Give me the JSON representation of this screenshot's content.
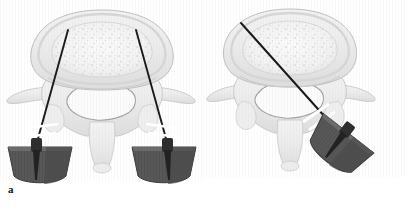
{
  "figure": {
    "caption_labels": {
      "panel_a": "a",
      "panel_b": "b"
    },
    "background_color": "#ffffff",
    "bone_fill_color": "#f0f0f0",
    "bone_outline_color": "#b8b8b8",
    "cancellous_speckle_color": "#cfcfcf",
    "needle_color": "#1a1a1a",
    "handle_color": "#5a5a5a",
    "handle_dark_color": "#3f3f3f",
    "break_mark_color": "#e8e8e8"
  },
  "panels": [
    {
      "id": "a",
      "label": "a",
      "title": "Bipedicular approach",
      "anatomy": "axial lumbar vertebra",
      "needle_count": 2,
      "instrument_count": 2,
      "parts": [
        "vertebral-body",
        "cancellous-bone",
        "spinal-canal",
        "left-transverse-process",
        "right-transverse-process",
        "spinous-process",
        "left-pedicle",
        "right-pedicle"
      ],
      "needles": [
        {
          "name": "left-needle",
          "entry": "left pedicle",
          "tip": "left anterior vertebral body"
        },
        {
          "name": "right-needle",
          "entry": "right pedicle",
          "tip": "right anterior vertebral body"
        }
      ],
      "instruments": [
        {
          "name": "left-handle",
          "type": "t-handle",
          "rotation_deg": 0
        },
        {
          "name": "right-handle",
          "type": "t-handle",
          "rotation_deg": 0
        }
      ]
    },
    {
      "id": "b",
      "label": "b",
      "title": "Unipedicular oblique approach",
      "anatomy": "axial lumbar vertebra",
      "needle_count": 1,
      "instrument_count": 1,
      "parts": [
        "vertebral-body",
        "cancellous-bone",
        "spinal-canal",
        "left-transverse-process",
        "right-transverse-process",
        "spinous-process",
        "right-pedicle"
      ],
      "needles": [
        {
          "name": "oblique-needle",
          "entry": "right pedicle",
          "tip": "contralateral anterior vertebral body"
        }
      ],
      "instruments": [
        {
          "name": "oblique-handle",
          "type": "t-handle",
          "rotation_deg": 38
        }
      ]
    }
  ]
}
